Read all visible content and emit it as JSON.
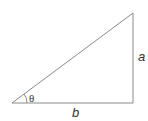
{
  "diagram": {
    "type": "right-triangle",
    "labels": {
      "opposite": "a",
      "adjacent": "b",
      "angle": "θ"
    },
    "colors": {
      "stroke": "#8a8a8a",
      "text": "#333333"
    }
  }
}
